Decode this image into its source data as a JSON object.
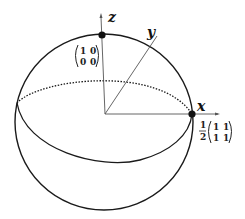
{
  "diagram": {
    "axes": {
      "x": {
        "label": "x"
      },
      "y": {
        "label": "y"
      },
      "z": {
        "label": "z"
      }
    },
    "points": [
      {
        "name": "north-pole",
        "axis": "z",
        "matrix": [
          [
            "1",
            "0"
          ],
          [
            "0",
            "0"
          ]
        ],
        "prefactor": ""
      },
      {
        "name": "x-point",
        "axis": "x",
        "matrix": [
          [
            "1",
            "1"
          ],
          [
            "1",
            "1"
          ]
        ],
        "prefactor_num": "1",
        "prefactor_den": "2"
      }
    ],
    "colors": {
      "stroke": "#1a1a1a",
      "axis": "#555555",
      "background": "#ffffff"
    }
  }
}
